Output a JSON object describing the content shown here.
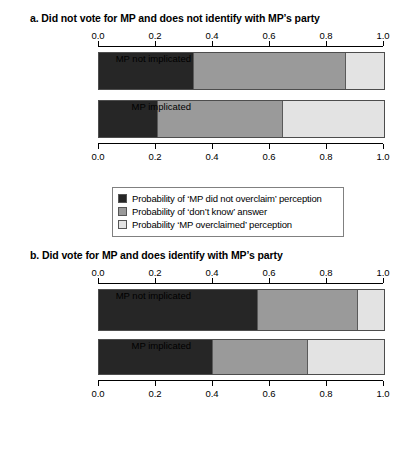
{
  "colors": {
    "dark": "#262626",
    "mid": "#9a9a9a",
    "light": "#e3e3e3",
    "axis": "#000000",
    "bar_border": "#4d4d4d",
    "legend_border": "#808080",
    "background": "#ffffff"
  },
  "legend": {
    "items": [
      {
        "swatch": "dark",
        "label": "Probability of ‘MP did not overclaim’ perception"
      },
      {
        "swatch": "mid",
        "label": "Probability of ‘don’t know’ answer"
      },
      {
        "swatch": "light",
        "label": "Probability ‘MP overclaimed’ perception"
      }
    ]
  },
  "axis": {
    "ticks": [
      0.0,
      0.2,
      0.4,
      0.6,
      0.8,
      1.0
    ],
    "tick_labels": [
      "0.0",
      "0.2",
      "0.4",
      "0.6",
      "0.8",
      "1.0"
    ],
    "range": [
      0.0,
      1.0
    ]
  },
  "panels": [
    {
      "id": "a",
      "title": "a. Did not vote for MP and does not identify with MP’s party",
      "categories": [
        "MP not implicated",
        "MP implicated"
      ]
    },
    {
      "id": "b",
      "title": "b. Did vote for MP and does identify with MP’s party",
      "categories": [
        "MP not implicated",
        "MP implicated"
      ]
    }
  ],
  "chart_data": [
    {
      "type": "bar",
      "orientation": "horizontal",
      "stacked": true,
      "stacked_mode": "proportional",
      "panel": "a",
      "title": "a. Did not vote for MP and does not identify with MP’s party",
      "xlabel": "",
      "ylabel": "",
      "xlim": [
        0.0,
        1.0
      ],
      "xticks": [
        0.0,
        0.2,
        0.4,
        0.6,
        0.8,
        1.0
      ],
      "grid": false,
      "legend_position": "below-plot",
      "categories": [
        "MP not implicated",
        "MP implicated"
      ],
      "series": [
        {
          "name": "Probability of ‘MP did not overclaim’ perception",
          "color": "#262626",
          "values": [
            0.333,
            0.207
          ]
        },
        {
          "name": "Probability of ‘don’t know’ answer",
          "color": "#9a9a9a",
          "values": [
            0.534,
            0.438
          ]
        },
        {
          "name": "Probability ‘MP overclaimed’ perception",
          "color": "#e3e3e3",
          "values": [
            0.133,
            0.355
          ]
        }
      ],
      "cumulative_boundaries": [
        [
          0.333,
          0.867
        ],
        [
          0.207,
          0.645
        ]
      ]
    },
    {
      "type": "bar",
      "orientation": "horizontal",
      "stacked": true,
      "stacked_mode": "proportional",
      "panel": "b",
      "title": "b. Did vote for MP and does identify with MP’s party",
      "xlabel": "",
      "ylabel": "",
      "xlim": [
        0.0,
        1.0
      ],
      "xticks": [
        0.0,
        0.2,
        0.4,
        0.6,
        0.8,
        1.0
      ],
      "grid": false,
      "legend_position": "below-plot",
      "categories": [
        "MP not implicated",
        "MP implicated"
      ],
      "series": [
        {
          "name": "Probability of ‘MP did not overclaim’ perception",
          "color": "#262626",
          "values": [
            0.558,
            0.4
          ]
        },
        {
          "name": "Probability of ‘don’t know’ answer",
          "color": "#9a9a9a",
          "values": [
            0.352,
            0.335
          ]
        },
        {
          "name": "Probability ‘MP overclaimed’ perception",
          "color": "#e3e3e3",
          "values": [
            0.09,
            0.265
          ]
        }
      ],
      "cumulative_boundaries": [
        [
          0.558,
          0.91
        ],
        [
          0.4,
          0.735
        ]
      ]
    }
  ]
}
